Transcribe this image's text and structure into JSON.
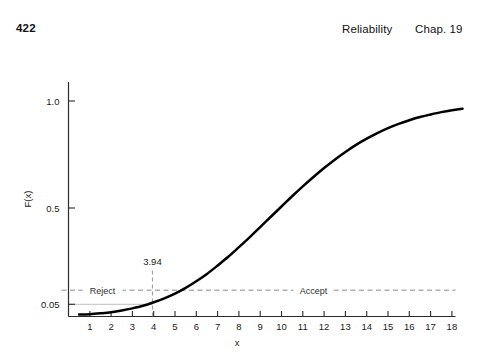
{
  "header": {
    "page_number": "422",
    "running_head": "Reliability",
    "chapter": "Chap. 19"
  },
  "chart_data": {
    "type": "line",
    "title": "",
    "xlabel": "x",
    "ylabel": "F(x)",
    "xlim": [
      0,
      19
    ],
    "ylim": [
      0,
      1.06
    ],
    "grid": false,
    "legend": null,
    "x_ticks": [
      1,
      2,
      3,
      4,
      5,
      6,
      7,
      8,
      9,
      10,
      11,
      12,
      13,
      14,
      15,
      16,
      17,
      18
    ],
    "x_tick_labels": [
      "1",
      "2",
      "3",
      "4",
      "5",
      "6",
      "7",
      "8",
      "9",
      "10",
      "11",
      "12",
      "13",
      "14",
      "15",
      "16",
      "17",
      "18"
    ],
    "y_ticks": [
      0.05,
      0.5,
      1.0
    ],
    "y_tick_labels": [
      "0.05",
      "0.5",
      "1.0"
    ],
    "series": [
      {
        "name": "F(x)",
        "color": "#000000",
        "x": [
          0.5,
          1,
          1.5,
          2,
          2.5,
          3,
          3.5,
          3.94,
          4.5,
          5,
          5.5,
          6,
          6.5,
          7,
          7.5,
          8,
          8.5,
          9,
          9.5,
          10,
          10.5,
          11,
          11.5,
          12,
          12.5,
          13,
          13.5,
          14,
          14.5,
          15,
          15.5,
          16,
          16.5,
          17,
          17.5,
          18,
          18.5
        ],
        "y": [
          0.002,
          0.004,
          0.008,
          0.013,
          0.021,
          0.031,
          0.043,
          0.057,
          0.078,
          0.1,
          0.127,
          0.158,
          0.192,
          0.231,
          0.272,
          0.317,
          0.363,
          0.411,
          0.459,
          0.507,
          0.555,
          0.601,
          0.645,
          0.687,
          0.726,
          0.762,
          0.795,
          0.824,
          0.85,
          0.873,
          0.893,
          0.91,
          0.925,
          0.937,
          0.948,
          0.957,
          0.964
        ]
      }
    ],
    "annotations": [
      {
        "name": "acceptance-threshold",
        "type": "hline",
        "y": 0.116,
        "style": "dashed",
        "labels": [
          {
            "name": "reject-region-label",
            "text": "Reject",
            "x": 1.6
          },
          {
            "name": "accept-region-label",
            "text": "Accept",
            "x": 11.5
          }
        ]
      },
      {
        "name": "critical-value-marker",
        "type": "vline",
        "x": 3.94,
        "style": "dashed",
        "label": "3.94"
      },
      {
        "name": "alpha-level-line",
        "type": "hline",
        "y": 0.05,
        "style": "solid-gray",
        "x_end": 3.94
      }
    ]
  }
}
